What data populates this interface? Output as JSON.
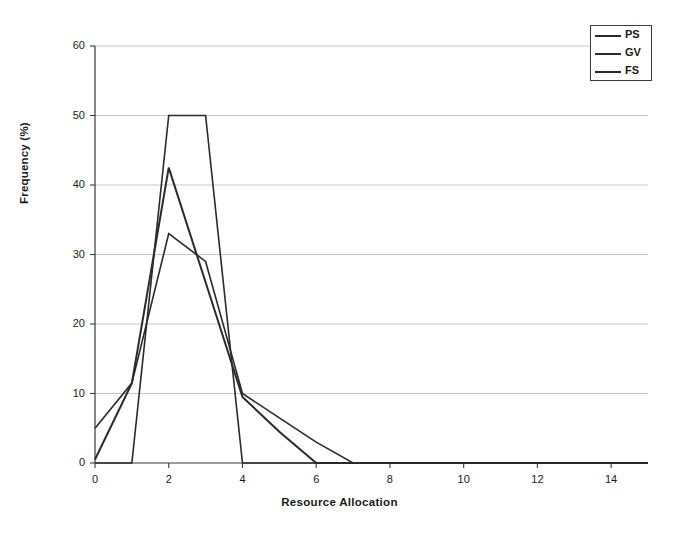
{
  "chart_data": {
    "type": "line",
    "title": "",
    "xlabel": "Resource Allocation",
    "ylabel": "Frequency (%)",
    "xlim": [
      0,
      15
    ],
    "ylim": [
      0,
      60
    ],
    "grid": true,
    "grid_axis": "y",
    "legend_position": "top-right",
    "x": [
      0,
      1,
      2,
      3,
      4,
      5,
      6,
      7,
      8,
      9,
      10,
      11,
      12,
      13,
      14,
      15
    ],
    "xticks": [
      0,
      2,
      4,
      6,
      8,
      10,
      12,
      14
    ],
    "xtick_labels": [
      "0",
      "2",
      "4",
      "6",
      "8",
      "10",
      "12",
      "14"
    ],
    "yticks": [
      0,
      10,
      20,
      30,
      40,
      50,
      60
    ],
    "ytick_labels": [
      "0",
      "10",
      "20",
      "30",
      "40",
      "50",
      "60"
    ],
    "series": [
      {
        "name": "PS",
        "color": "#2a2a2a",
        "values": [
          0.5,
          11.5,
          42.5,
          26.0,
          9.5,
          4.5,
          0,
          0,
          0,
          0,
          0,
          0,
          0,
          0,
          0,
          0
        ]
      },
      {
        "name": "GV",
        "color": "#2a2a2a",
        "values": [
          5.0,
          11.5,
          33.0,
          29.0,
          10.0,
          6.5,
          3.0,
          0,
          0,
          0,
          0,
          0,
          0,
          0,
          0,
          0
        ]
      },
      {
        "name": "FS",
        "color": "#2a2a2a",
        "values": [
          0,
          0,
          50.0,
          50.0,
          0,
          0,
          0,
          0,
          0,
          0,
          0,
          0,
          0,
          0,
          0,
          0
        ]
      }
    ]
  },
  "legend": {
    "entries": [
      {
        "label": "PS"
      },
      {
        "label": "GV"
      },
      {
        "label": "FS"
      }
    ]
  },
  "axes": {
    "x_title": "Resource Allocation",
    "y_title": "Frequency (%)"
  }
}
